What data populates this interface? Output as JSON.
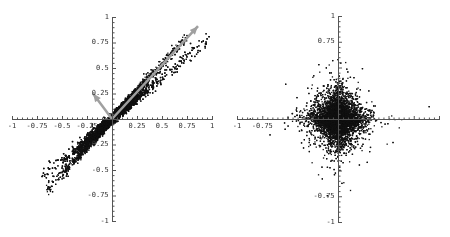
{
  "chart_data": [
    {
      "type": "scatter",
      "title": "",
      "xlabel": "",
      "ylabel": "",
      "xlim": [
        -1,
        1
      ],
      "ylim": [
        -1,
        1
      ],
      "grid": false,
      "x_ticks": [
        "-1",
        "-0.75",
        "-0.5",
        "-0.25",
        "0.25",
        "0.5",
        "0.75",
        "1"
      ],
      "y_ticks": [
        "1",
        "0.75",
        "0.5",
        "0.25",
        "-0.25",
        "-0.5",
        "-0.75",
        "-1"
      ],
      "description": "Mixed data: two dense linear clusters along lines y≈1.05x and y≈0.8x through the origin, extending from about (-0.7,-0.9) to (0.95,0.9)",
      "clusters": [
        {
          "name": "line A",
          "slope": 1.08,
          "spread": 0.02,
          "x_range": [
            -0.65,
            0.75
          ],
          "points": 4000
        },
        {
          "name": "line B",
          "slope": 0.82,
          "spread": 0.025,
          "x_range": [
            -0.7,
            0.97
          ],
          "points": 4000
        }
      ],
      "arrows": [
        {
          "from": [
            0,
            0
          ],
          "to": [
            0.86,
            0.91
          ],
          "color": "#a0a0a0"
        },
        {
          "from": [
            0,
            0
          ],
          "to": [
            -0.19,
            0.25
          ],
          "color": "#a0a0a0"
        }
      ]
    },
    {
      "type": "scatter",
      "title": "",
      "xlabel": "",
      "ylabel": "",
      "xlim": [
        -1,
        1
      ],
      "ylim": [
        -1,
        1
      ],
      "grid": false,
      "x_ticks": [
        "-1",
        "-0.75"
      ],
      "y_ticks": [
        "1",
        "0.75",
        "-0.75",
        "-1"
      ],
      "description": "Unmixed/whitened data: super-Gaussian cross-shaped cloud concentrated along both axes centered at origin",
      "clusters": [
        {
          "name": "sparse cross",
          "distribution": "laplacian",
          "scale": 0.08,
          "points": 9000
        }
      ]
    }
  ]
}
